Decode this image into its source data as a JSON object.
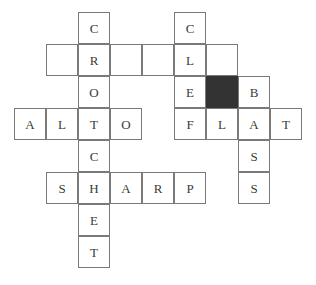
{
  "puzzle": {
    "title": "Music Crossword Grid",
    "grid_origin": {
      "x": 14,
      "y": 12
    },
    "cell_size": 32,
    "colors": {
      "cell_border": "#7a7a7a",
      "cell_background": "#ffffff",
      "blocked_background": "#333333",
      "letter_color": "#3a3a3a",
      "page_background": "#ffffff"
    },
    "answers": {
      "crochet": "CROCHET",
      "clef": "CLEF",
      "alto": "ALTO",
      "flat": "FLAT",
      "sharp": "SHARP",
      "bass": "BASS"
    },
    "cells": [
      {
        "row": 0,
        "col": 2,
        "letter": "C",
        "state": "filled"
      },
      {
        "row": 0,
        "col": 5,
        "letter": "C",
        "state": "filled"
      },
      {
        "row": 1,
        "col": 1,
        "letter": "",
        "state": "empty"
      },
      {
        "row": 1,
        "col": 2,
        "letter": "R",
        "state": "filled"
      },
      {
        "row": 1,
        "col": 3,
        "letter": "",
        "state": "empty"
      },
      {
        "row": 1,
        "col": 4,
        "letter": "",
        "state": "empty"
      },
      {
        "row": 1,
        "col": 5,
        "letter": "L",
        "state": "filled"
      },
      {
        "row": 1,
        "col": 6,
        "letter": "",
        "state": "empty"
      },
      {
        "row": 2,
        "col": 2,
        "letter": "O",
        "state": "filled"
      },
      {
        "row": 2,
        "col": 5,
        "letter": "E",
        "state": "filled"
      },
      {
        "row": 2,
        "col": 6,
        "letter": "",
        "state": "blocked"
      },
      {
        "row": 2,
        "col": 7,
        "letter": "B",
        "state": "filled"
      },
      {
        "row": 3,
        "col": 0,
        "letter": "A",
        "state": "filled"
      },
      {
        "row": 3,
        "col": 1,
        "letter": "L",
        "state": "filled"
      },
      {
        "row": 3,
        "col": 2,
        "letter": "T",
        "state": "filled"
      },
      {
        "row": 3,
        "col": 3,
        "letter": "O",
        "state": "filled"
      },
      {
        "row": 3,
        "col": 5,
        "letter": "F",
        "state": "filled"
      },
      {
        "row": 3,
        "col": 6,
        "letter": "L",
        "state": "filled"
      },
      {
        "row": 3,
        "col": 7,
        "letter": "A",
        "state": "filled"
      },
      {
        "row": 3,
        "col": 8,
        "letter": "T",
        "state": "filled"
      },
      {
        "row": 4,
        "col": 2,
        "letter": "C",
        "state": "filled"
      },
      {
        "row": 4,
        "col": 7,
        "letter": "S",
        "state": "filled"
      },
      {
        "row": 5,
        "col": 1,
        "letter": "S",
        "state": "filled"
      },
      {
        "row": 5,
        "col": 2,
        "letter": "H",
        "state": "filled"
      },
      {
        "row": 5,
        "col": 3,
        "letter": "A",
        "state": "filled"
      },
      {
        "row": 5,
        "col": 4,
        "letter": "R",
        "state": "filled"
      },
      {
        "row": 5,
        "col": 5,
        "letter": "P",
        "state": "filled"
      },
      {
        "row": 5,
        "col": 7,
        "letter": "S",
        "state": "filled"
      },
      {
        "row": 6,
        "col": 2,
        "letter": "E",
        "state": "filled"
      },
      {
        "row": 7,
        "col": 2,
        "letter": "T",
        "state": "filled"
      }
    ]
  }
}
